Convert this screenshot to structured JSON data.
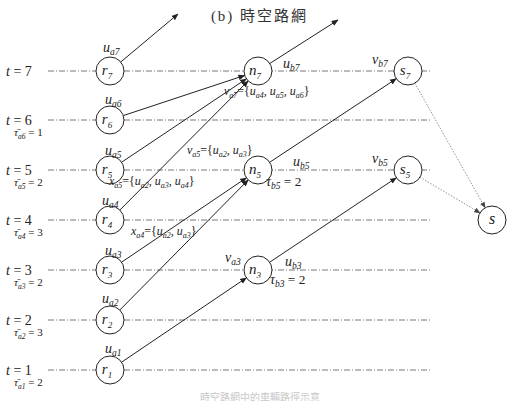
{
  "title": "(b) 時空路網",
  "caption": "時空路網中的車輛路徑示意圖",
  "colors": {
    "line": "#222222",
    "dash": "#555555",
    "dotted": "#888888",
    "caption": "#c8c8c8"
  },
  "time_rows": [
    {
      "t": 7,
      "label": "t = 7",
      "y": 71
    },
    {
      "t": 6,
      "label": "t = 6",
      "y": 120
    },
    {
      "t": 5,
      "label": "t = 5",
      "y": 170
    },
    {
      "t": 4,
      "label": "t = 4",
      "y": 220
    },
    {
      "t": 3,
      "label": "t = 3",
      "y": 270
    },
    {
      "t": 2,
      "label": "t = 2",
      "y": 320
    },
    {
      "t": 1,
      "label": "t = 1",
      "y": 370
    }
  ],
  "tau_labels": [
    {
      "text": "τ̄a6 = 1",
      "base": "τ",
      "sub": "a6",
      "value": "= 1",
      "x": 14,
      "y": 136
    },
    {
      "text": "τ̄a5 = 2",
      "base": "τ",
      "sub": "a5",
      "value": "= 2",
      "x": 14,
      "y": 186
    },
    {
      "text": "τ̄a4 = 3",
      "base": "τ",
      "sub": "a4",
      "value": "= 3",
      "x": 14,
      "y": 236
    },
    {
      "text": "τ̄a3 = 2",
      "base": "τ",
      "sub": "a3",
      "value": "= 2",
      "x": 14,
      "y": 286
    },
    {
      "text": "τ̄a2 = 3",
      "base": "τ",
      "sub": "a2",
      "value": "= 3",
      "x": 14,
      "y": 336
    },
    {
      "text": "τ̄a1 = 2",
      "base": "τ",
      "sub": "a1",
      "value": "= 2",
      "x": 14,
      "y": 386
    }
  ],
  "nodes": [
    {
      "id": "r7",
      "base": "r",
      "sub": "7",
      "x": 110,
      "y": 71
    },
    {
      "id": "r6",
      "base": "r",
      "sub": "6",
      "x": 110,
      "y": 120
    },
    {
      "id": "r5",
      "base": "r",
      "sub": "5",
      "x": 110,
      "y": 170
    },
    {
      "id": "r4",
      "base": "r",
      "sub": "4",
      "x": 110,
      "y": 220
    },
    {
      "id": "r3",
      "base": "r",
      "sub": "3",
      "x": 110,
      "y": 270
    },
    {
      "id": "r2",
      "base": "r",
      "sub": "2",
      "x": 110,
      "y": 320
    },
    {
      "id": "r1",
      "base": "r",
      "sub": "1",
      "x": 110,
      "y": 370
    },
    {
      "id": "n7",
      "base": "n",
      "sub": "7",
      "x": 258,
      "y": 71
    },
    {
      "id": "n5",
      "base": "n",
      "sub": "5",
      "x": 258,
      "y": 170
    },
    {
      "id": "n3",
      "base": "n",
      "sub": "3",
      "x": 258,
      "y": 270
    },
    {
      "id": "s7",
      "base": "s",
      "sub": "7",
      "x": 408,
      "y": 71
    },
    {
      "id": "s5",
      "base": "s",
      "sub": "5",
      "x": 408,
      "y": 170
    },
    {
      "id": "S",
      "base": "s",
      "sub": "",
      "x": 492,
      "y": 220
    }
  ],
  "edges": [
    {
      "from": "r7",
      "to_xy": [
        178,
        14
      ],
      "label": "u_a7"
    },
    {
      "from": "r6",
      "to": "n7",
      "label": "u_a6"
    },
    {
      "from": "r5",
      "to": "n7",
      "label": "u_a5"
    },
    {
      "from": "r4",
      "to": "n7",
      "label": "u_a4"
    },
    {
      "from": "r3",
      "to": "n5",
      "label": "u_a3"
    },
    {
      "from": "r2",
      "to": "n5",
      "label": "u_a2"
    },
    {
      "from": "r1",
      "to": "n3",
      "label": "u_a1"
    },
    {
      "from": "n7",
      "to_xy": [
        338,
        20
      ],
      "label": "u_b7"
    },
    {
      "from": "n5",
      "to": "s7",
      "label": "u_b5"
    },
    {
      "from": "n3",
      "to": "s5",
      "label": "u_b3"
    },
    {
      "from": "s7",
      "to": "S",
      "style": "dotted"
    },
    {
      "from": "s5",
      "to": "S",
      "style": "dotted"
    }
  ],
  "labels": [
    {
      "id": "u_a7",
      "base": "u",
      "sub": "a7",
      "x": 103,
      "y": 52
    },
    {
      "id": "u_a6",
      "base": "u",
      "sub": "a6",
      "x": 105,
      "y": 104
    },
    {
      "id": "u_a5",
      "base": "u",
      "sub": "a5",
      "x": 105,
      "y": 155
    },
    {
      "id": "u_a4",
      "base": "u",
      "sub": "a4",
      "x": 102,
      "y": 205
    },
    {
      "id": "u_a3",
      "base": "u",
      "sub": "a3",
      "x": 105,
      "y": 255
    },
    {
      "id": "u_a2",
      "base": "u",
      "sub": "a2",
      "x": 102,
      "y": 303
    },
    {
      "id": "u_a1",
      "base": "u",
      "sub": "a1",
      "x": 105,
      "y": 353
    },
    {
      "id": "u_b7",
      "base": "u",
      "sub": "b7",
      "x": 283,
      "y": 68
    },
    {
      "id": "u_b5",
      "base": "u",
      "sub": "b5",
      "x": 293,
      "y": 166
    },
    {
      "id": "u_b3",
      "base": "u",
      "sub": "b3",
      "x": 285,
      "y": 266
    },
    {
      "id": "v_b7",
      "base": "v",
      "sub": "b7",
      "x": 372,
      "y": 64
    },
    {
      "id": "v_b5",
      "base": "v",
      "sub": "b5",
      "x": 372,
      "y": 163
    },
    {
      "id": "v_a3",
      "base": "v",
      "sub": "a3",
      "x": 225,
      "y": 262
    },
    {
      "id": "tau_b5",
      "base": "τ",
      "sub": "b5",
      "value": "= 2",
      "x": 266,
      "y": 186
    },
    {
      "id": "tau_b3",
      "base": "τ",
      "sub": "b3",
      "value": "= 2",
      "x": 270,
      "y": 284
    }
  ],
  "set_labels": [
    {
      "id": "v_a7",
      "base": "v",
      "sub": "a7",
      "set": [
        "u_a4",
        "u_a5",
        "u_a6"
      ],
      "text": "v_a7 = {u_a4, u_a5, u_a6}",
      "x": 224,
      "y": 95
    },
    {
      "id": "v_a5",
      "base": "v",
      "sub": "a5",
      "set": [
        "u_a2",
        "u_a3"
      ],
      "text": "v_a5 = {u_a2, u_a3}",
      "x": 187,
      "y": 154
    },
    {
      "id": "x_a5",
      "base": "x",
      "sub": "a5",
      "set": [
        "u_a2",
        "u_a3",
        "u_a4"
      ],
      "text": "x_a5 = {u_a2, u_a3, u_a4}",
      "x": 109,
      "y": 185
    },
    {
      "id": "x_a4",
      "base": "x",
      "sub": "a4",
      "set": [
        "u_a2",
        "u_a3"
      ],
      "text": "x_a4 = {u_a2, u_a3}",
      "x": 131,
      "y": 235
    }
  ]
}
